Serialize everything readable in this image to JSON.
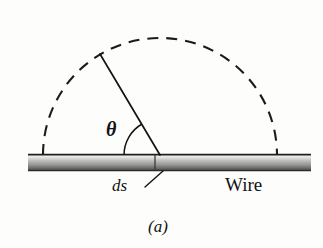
{
  "figure": {
    "caption": "(a)",
    "background_color": "#fdfdfb",
    "ink_color": "#131313",
    "labels": {
      "angle": "θ",
      "element": "ds",
      "wire": "Wire"
    },
    "geometry": {
      "wire": {
        "x_start": 28,
        "x_end": 311,
        "y_top": 154,
        "y_bottom": 171,
        "segment_divider_x": 155,
        "highlight_color": "#f2f2f0",
        "mid_color": "#b3b3b1",
        "shadow_color": "#4e4e4e"
      },
      "arc": {
        "center_x": 160,
        "center_y": 155,
        "radius": 117,
        "style": "dashed",
        "dash_pattern": "11 8",
        "stroke_width": 2.1
      },
      "radius_line": {
        "from_x": 160,
        "from_y": 155,
        "to_x": 100,
        "to_y": 54,
        "stroke_width": 1.7
      },
      "angle_arc": {
        "center_x": 160,
        "center_y": 155,
        "radius": 36,
        "start_deg": 180,
        "end_deg": 120,
        "stroke_width": 1.5
      },
      "ds_leader": {
        "from_x": 162,
        "from_y": 171,
        "to_x": 145,
        "to_y": 187,
        "stroke_width": 1.4
      }
    }
  }
}
